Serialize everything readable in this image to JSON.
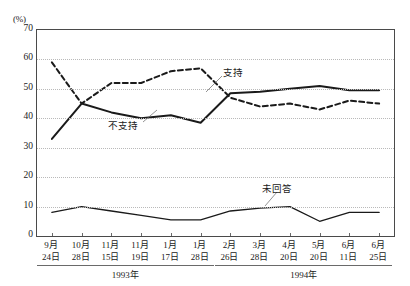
{
  "chart_data": {
    "type": "line",
    "title": "",
    "xlabel": "",
    "ylabel": "(%)",
    "ylim": [
      0,
      70
    ],
    "ytick_values": [
      0,
      10,
      20,
      30,
      40,
      50,
      60,
      70
    ],
    "ytick_labels": [
      "0",
      "10",
      "20",
      "30",
      "40",
      "50",
      "60",
      "70"
    ],
    "grid": "horizontal-dotted",
    "legend": "inline-annotations",
    "categories": [
      {
        "month": "9月",
        "day": "24日"
      },
      {
        "month": "10月",
        "day": "28日"
      },
      {
        "month": "11月",
        "day": "15日"
      },
      {
        "month": "11月",
        "day": "19日"
      },
      {
        "month": "1月",
        "day": "17日"
      },
      {
        "month": "1月",
        "day": "28日"
      },
      {
        "month": "2月",
        "day": "26日"
      },
      {
        "month": "3月",
        "day": "28日"
      },
      {
        "month": "4月",
        "day": "20日"
      },
      {
        "month": "5月",
        "day": "20日"
      },
      {
        "month": "6月",
        "day": "11日"
      },
      {
        "month": "6月",
        "day": "25日"
      }
    ],
    "series": [
      {
        "name": "支持",
        "style": "dashed",
        "color": "#1a1a1a",
        "values": [
          59,
          45,
          52,
          52,
          56,
          57,
          47,
          44,
          45,
          43,
          46,
          45
        ]
      },
      {
        "name": "不支持",
        "style": "solid",
        "color": "#1a1a1a",
        "values": [
          33,
          45,
          42,
          40,
          41,
          38.5,
          48.5,
          49,
          50,
          51,
          49.5,
          49.5
        ]
      },
      {
        "name": "未回答",
        "style": "solid",
        "color": "#1a1a1a",
        "values": [
          8,
          10,
          8.5,
          7,
          5.5,
          5.5,
          8.5,
          9.5,
          10,
          5,
          8,
          8
        ]
      }
    ],
    "year_groups": [
      {
        "label": "1993年",
        "from_index": 0,
        "to_index": 5
      },
      {
        "label": "1994年",
        "from_index": 6,
        "to_index": 11
      }
    ],
    "annotations": [
      {
        "text": "支持",
        "series": "支持"
      },
      {
        "text": "不支持",
        "series": "不支持"
      },
      {
        "text": "未回答",
        "series": "未回答"
      }
    ]
  }
}
